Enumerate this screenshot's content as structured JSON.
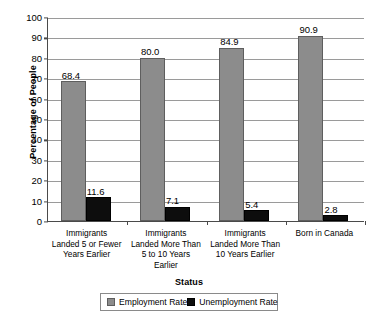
{
  "chart_data": {
    "type": "bar",
    "title": "",
    "xlabel": "Status",
    "ylabel": "Percentage of People",
    "ylim": [
      0,
      100
    ],
    "yticks": [
      0,
      10,
      20,
      30,
      40,
      50,
      60,
      70,
      80,
      90,
      100
    ],
    "grid": true,
    "legend_position": "bottom-center",
    "categories": [
      "Immigrants\nLanded 5 or Fewer\nYears Earlier",
      "Immigrants\nLanded More Than\n5 to 10 Years\nEarlier",
      "Immigrants\nLanded More Than\n10 Years Earlier",
      "Born in Canada"
    ],
    "series": [
      {
        "name": "Employment Rate",
        "color": "#8C8C8C",
        "values": [
          68.4,
          80.0,
          84.9,
          90.9
        ],
        "labels": [
          "68.4",
          "80.0",
          "84.9",
          "90.9"
        ]
      },
      {
        "name": "Unemployment Rate",
        "color": "#0D0D0D",
        "values": [
          11.6,
          7.1,
          5.4,
          2.8
        ],
        "labels": [
          "11.6",
          "7.1",
          "5.4",
          "2.8"
        ]
      }
    ],
    "ytick_labels": [
      "0",
      "10",
      "20",
      "30",
      "40",
      "50",
      "60",
      "70",
      "80",
      "90",
      "100"
    ],
    "legend_entries": [
      "Employment Rate",
      "Unemployment Rate"
    ]
  }
}
